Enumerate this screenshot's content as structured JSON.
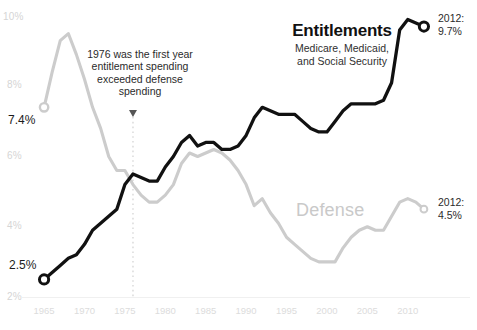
{
  "chart_data": {
    "type": "line",
    "title": "",
    "xlabel": "",
    "ylabel": "",
    "xlim": [
      1964,
      2013
    ],
    "ylim": [
      2,
      10
    ],
    "grid": false,
    "legend_position": "inline-labels",
    "y_ticks": [
      "2%",
      "4%",
      "6%",
      "8%",
      "10%"
    ],
    "y_tick_values": [
      2,
      4,
      6,
      8,
      10
    ],
    "x_ticks": [
      "1965",
      "1970",
      "1975",
      "1980",
      "1985",
      "1990",
      "1995",
      "2000",
      "2005",
      "2010"
    ],
    "x_tick_values": [
      1965,
      1970,
      1975,
      1980,
      1985,
      1990,
      1995,
      2000,
      2005,
      2010
    ],
    "series": [
      {
        "name": "Entitlements",
        "color": "#111111",
        "x": [
          1965,
          1966,
          1967,
          1968,
          1969,
          1970,
          1971,
          1972,
          1973,
          1974,
          1975,
          1976,
          1977,
          1978,
          1979,
          1980,
          1981,
          1982,
          1983,
          1984,
          1985,
          1986,
          1987,
          1988,
          1989,
          1990,
          1991,
          1992,
          1993,
          1994,
          1995,
          1996,
          1997,
          1998,
          1999,
          2000,
          2001,
          2002,
          2003,
          2004,
          2005,
          2006,
          2007,
          2008,
          2009,
          2010,
          2011,
          2012
        ],
        "values": [
          2.5,
          2.7,
          2.9,
          3.1,
          3.2,
          3.5,
          3.9,
          4.1,
          4.3,
          4.5,
          5.2,
          5.5,
          5.4,
          5.3,
          5.3,
          5.7,
          6.0,
          6.4,
          6.6,
          6.3,
          6.4,
          6.4,
          6.2,
          6.2,
          6.3,
          6.6,
          7.1,
          7.4,
          7.3,
          7.2,
          7.2,
          7.2,
          7.0,
          6.8,
          6.7,
          6.7,
          7.0,
          7.3,
          7.5,
          7.5,
          7.5,
          7.5,
          7.6,
          8.1,
          9.6,
          9.9,
          9.8,
          9.7
        ],
        "start_label": "2.5%",
        "end_label": "9.7%",
        "end_year": "2012",
        "subtitle": "Medicare, Medicaid, and Social Security"
      },
      {
        "name": "Defense",
        "color": "#cccccc",
        "x": [
          1965,
          1966,
          1967,
          1968,
          1969,
          1970,
          1971,
          1972,
          1973,
          1974,
          1975,
          1976,
          1977,
          1978,
          1979,
          1980,
          1981,
          1982,
          1983,
          1984,
          1985,
          1986,
          1987,
          1988,
          1989,
          1990,
          1991,
          1992,
          1993,
          1994,
          1995,
          1996,
          1997,
          1998,
          1999,
          2000,
          2001,
          2002,
          2003,
          2004,
          2005,
          2006,
          2007,
          2008,
          2009,
          2010,
          2011,
          2012
        ],
        "values": [
          7.4,
          8.4,
          9.3,
          9.5,
          8.9,
          8.2,
          7.4,
          6.8,
          6.0,
          5.6,
          5.6,
          5.2,
          4.9,
          4.7,
          4.7,
          4.9,
          5.2,
          5.8,
          6.1,
          6.0,
          6.1,
          6.2,
          6.1,
          5.9,
          5.6,
          5.2,
          4.6,
          4.8,
          4.4,
          4.1,
          3.7,
          3.5,
          3.3,
          3.1,
          3.0,
          3.0,
          3.0,
          3.4,
          3.7,
          3.9,
          4.0,
          3.9,
          3.9,
          4.3,
          4.7,
          4.8,
          4.7,
          4.5
        ],
        "start_label": "7.4%",
        "end_label": "4.5%",
        "end_year": "2012"
      }
    ],
    "annotations": [
      {
        "id": "crossover-1976",
        "text": "1976 was the first year entitlement spending exceeded defense spending",
        "year": 1976,
        "marker": "down-arrow-with-dotted-line"
      }
    ]
  },
  "labels": {
    "entitlements_title": "Entitlements",
    "entitlements_subtitle_line1": "Medicare, Medicaid,",
    "entitlements_subtitle_line2": "and Social Security",
    "defense_title": "Defense",
    "annotation_text": "1976 was the first year entitlement spending exceeded defense spending",
    "entitlements_start_value": "2.5%",
    "defense_start_value": "7.4%",
    "entitlements_end_year": "2012:",
    "entitlements_end_value": "9.7%",
    "defense_end_year": "2012:",
    "defense_end_value": "4.5%"
  },
  "colors": {
    "entitlements_line": "#111111",
    "defense_line": "#cccccc",
    "axis_text": "#dcdcdc",
    "annotation_text": "#2b2b2b"
  }
}
